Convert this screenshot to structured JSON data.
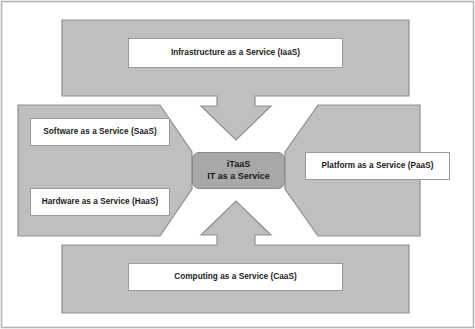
{
  "diagram": {
    "title_text": "",
    "colors": {
      "block_fill": "#bfbfbf",
      "block_stroke": "#8f8f8f",
      "center_fill": "#a8a8a8",
      "center_stroke": "#8a8a8a",
      "box_fill": "#ffffff",
      "box_stroke": "#9a9a9a",
      "text": "#1a1a1a",
      "frame": "#b5b5b5",
      "background": "#ffffff"
    },
    "center_node": {
      "name": "iTaaS",
      "line_1": "iTaaS",
      "line_2": "IT as a Service"
    },
    "blocks": [
      {
        "id": "top",
        "arrow_direction": "down",
        "labels": [
          {
            "id": "iaas",
            "text": "Infrastructure as a Service (IaaS)"
          }
        ]
      },
      {
        "id": "left",
        "arrow_direction": "right",
        "labels": [
          {
            "id": "saas",
            "text": "Software as a Service (SaaS)"
          },
          {
            "id": "haas",
            "text": "Hardware as a Service (HaaS)"
          }
        ]
      },
      {
        "id": "right",
        "arrow_direction": "left",
        "labels": [
          {
            "id": "paas",
            "text": "Platform as a Service (PaaS)"
          }
        ]
      },
      {
        "id": "bottom",
        "arrow_direction": "up",
        "labels": [
          {
            "id": "caas",
            "text": "Computing as a Service (CaaS)"
          }
        ]
      }
    ]
  }
}
